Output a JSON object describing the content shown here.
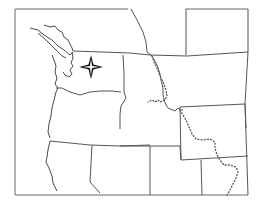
{
  "map": {
    "type": "outline-map",
    "region": "Pacific Northwest / Western United States",
    "style": "blank outline, no labels",
    "colors": {
      "background": "#ffffff",
      "border_line": "#555555",
      "frame": "#6a6a6a",
      "marker": "#1a1a1a"
    },
    "features": {
      "frame": "map-frame",
      "marker": "compass-star-marker",
      "continental_divide": "dotted-line",
      "states_visible": [
        "Washington",
        "Oregon",
        "Idaho",
        "Montana",
        "Wyoming",
        "Nevada",
        "Utah",
        "Colorado",
        "California"
      ]
    },
    "marker_position": {
      "x": 91,
      "y": 67
    }
  }
}
